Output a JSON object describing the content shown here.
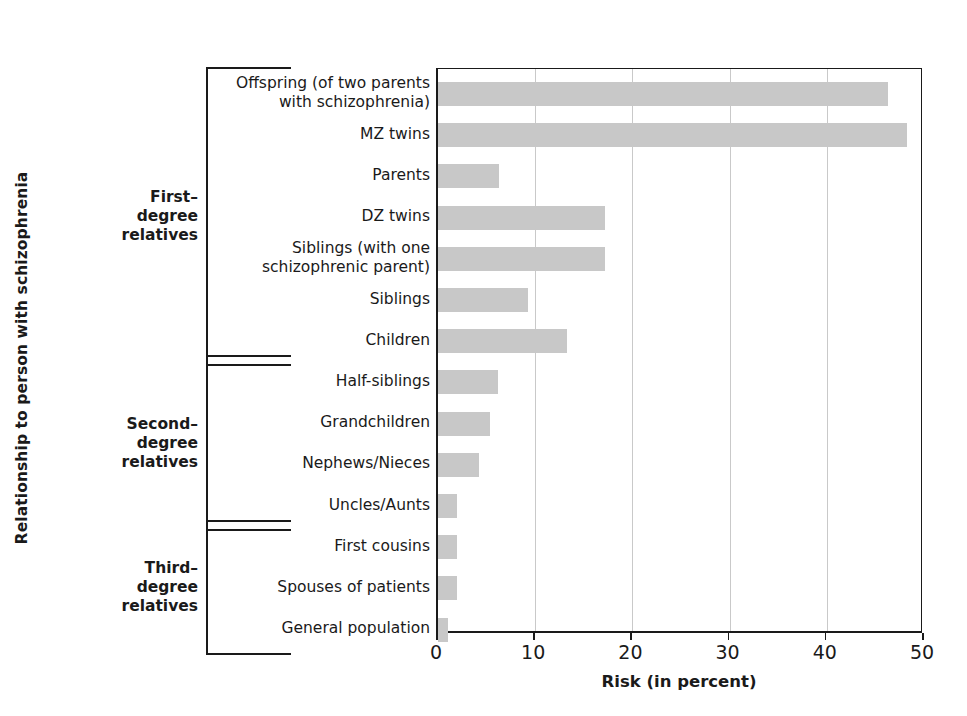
{
  "chart_data": {
    "type": "bar",
    "orientation": "horizontal",
    "title": "",
    "xlabel": "Risk (in percent)",
    "ylabel": "Relationship to person with schizophrenia",
    "xlim": [
      0,
      50
    ],
    "xticks": [
      0,
      10,
      20,
      30,
      40,
      50
    ],
    "xtick_labels": [
      "0",
      "10",
      "20",
      "30",
      "40",
      "50"
    ],
    "grid": "vertical",
    "legend": "none",
    "bar_color": "#c8c8c8",
    "axis_color": "#1a1a1a",
    "categories": [
      "Offspring (of two parents\nwith schizophrenia)",
      "MZ twins",
      "Parents",
      "DZ twins",
      "Siblings (with one\nschizophrenic parent)",
      "Siblings",
      "Children",
      "Half-siblings",
      "Grandchildren",
      "Nephews/Nieces",
      "Uncles/Aunts",
      "First cousins",
      "Spouses  of patients",
      "General population"
    ],
    "values": [
      46.3,
      48.3,
      6.3,
      17.2,
      17.2,
      9.3,
      13.3,
      6.2,
      5.4,
      4.2,
      2.0,
      2.0,
      2.0,
      1.0
    ],
    "groups": [
      {
        "label": "First–\ndegree\nrelatives",
        "from": 0,
        "to": 6
      },
      {
        "label": "Second–\ndegree\nrelatives",
        "from": 7,
        "to": 10
      },
      {
        "label": "Third–\ndegree\nrelatives",
        "from": 11,
        "to": 13
      }
    ]
  }
}
